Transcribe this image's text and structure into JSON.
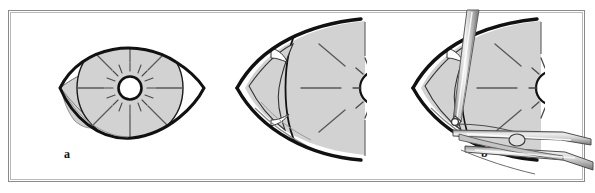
{
  "figure": {
    "type": "surgical-illustration",
    "title": "",
    "panel_count": 3,
    "frame": {
      "outer_border_color": "#8a8a8a",
      "inner_border_color": "#b9b9b9",
      "background_color": "#ffffff"
    },
    "palette": {
      "outline": "#111111",
      "tissue_fill": "#d2d2d2",
      "tissue_fill_light": "#dedede",
      "instrument_light": "#f0f0f0",
      "instrument_mid": "#b8b8b8",
      "instrument_dark": "#6e6e6e",
      "pupil_fill": "#ffffff",
      "spoke_line": "#4a4a4a"
    },
    "panels": [
      {
        "id": "a",
        "label": "a",
        "caption": "",
        "description": "Frontal view of eye: almond-shaped palpebral fissure with large circular shaded globe/iris bearing eight radial spokes, central white pupil ringed in black with radiating hatch marks, and a small shaded caruncle wedge at the medial canthus.",
        "elements": [
          "eyelid-outline",
          "iris-disc",
          "radial-spokes",
          "pupil",
          "pupil-hatch-marks",
          "caruncle-wedge"
        ],
        "spoke_count": 8,
        "pupil_hatch_count": 16
      },
      {
        "id": "b",
        "label": "b",
        "caption": "",
        "description": "Close-up of the medial canthal angle, cropped at the right edge. Shaded globe with radial spokes and half pupil visible; medial canthal fold and eyelid margin flaps drawn over the nasal aspect.",
        "elements": [
          "canthal-outline",
          "globe-shading",
          "radial-spokes",
          "half-pupil",
          "epicanthal-fold",
          "lid-margin-flap"
        ],
        "spoke_count": 4,
        "cropped_edge": "right"
      },
      {
        "id": "c",
        "label": "c",
        "caption": "",
        "description": "Same medial canthal close-up as panel b with surgical instruments in place: a fine straight needle-holder/probe entering from above at the canthal angle, and a pair of forceps/scissors with a ring hinge approaching from the lower right to grasp the lid margin.",
        "elements": [
          "canthal-outline",
          "globe-shading",
          "radial-spokes",
          "half-pupil",
          "epicanthal-fold",
          "needle-probe-instrument",
          "forceps-instrument",
          "forceps-hinge-ring",
          "suture-thread"
        ],
        "instruments": [
          {
            "name": "needle-probe",
            "orientation": "from-upper-left",
            "tip_at": "medial-canthal-angle"
          },
          {
            "name": "forceps",
            "orientation": "from-lower-right",
            "tip_at": "lower-lid-margin"
          }
        ],
        "cropped_edge": "right"
      }
    ]
  }
}
